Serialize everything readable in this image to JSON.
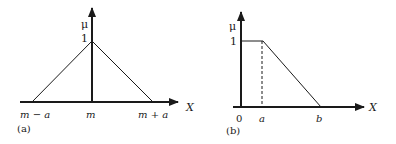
{
  "figure": {
    "panel_a": {
      "caption": "(a)",
      "y_axis_label": "μ",
      "y_tick": "1",
      "x_axis_label": "X",
      "x_ticks": [
        "m − a",
        "m",
        "m + a"
      ],
      "shape": "triangular membership function",
      "points": [
        [
          "m − a",
          0
        ],
        [
          "m",
          1
        ],
        [
          "m + a",
          0
        ]
      ]
    },
    "panel_b": {
      "caption": "(b)",
      "y_axis_label": "μ",
      "y_tick": "1",
      "x_axis_label": "X",
      "x_ticks": [
        "0",
        "a",
        "b"
      ],
      "shape": "left-shoulder (trapezoidal) membership function",
      "points": [
        [
          "0",
          1
        ],
        [
          "a",
          1
        ],
        [
          "b",
          0
        ]
      ]
    },
    "colors": {
      "line": "#1a1a1a",
      "background": "#ffffff"
    }
  }
}
